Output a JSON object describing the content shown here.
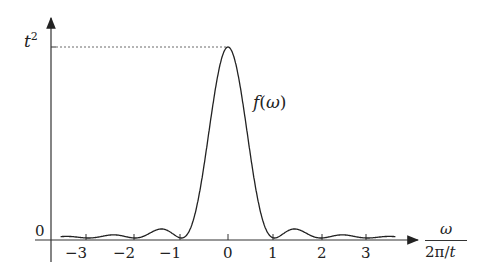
{
  "chart_data": {
    "type": "line",
    "title": "",
    "xlabel": "ω / (2π/t)",
    "ylabel": "",
    "curve_label": "f(ω)",
    "x_ticks": [
      -3,
      -2,
      -1,
      0,
      1,
      2,
      3
    ],
    "y_ticks": [
      "0",
      "t²"
    ],
    "x": [
      -3.5,
      -3,
      -2.5,
      -2,
      -1.5,
      -1,
      -0.5,
      0,
      0.5,
      1,
      1.5,
      2,
      2.5,
      3,
      3.5
    ],
    "values": [
      0.01,
      0,
      0.02,
      0,
      0.05,
      0,
      0.41,
      1,
      0.41,
      0,
      0.05,
      0,
      0.02,
      0,
      0.01
    ],
    "peak_value_label": "t²",
    "grid": false,
    "color": "#222222"
  },
  "labels": {
    "y_top": "t",
    "y_top_sup": "2",
    "y_zero": "0",
    "curve": "f(ω)",
    "x_num": "ω",
    "x_den": "2π/t",
    "ticks": [
      "−3",
      "−2",
      "−1",
      "0",
      "1",
      "2",
      "3"
    ]
  }
}
